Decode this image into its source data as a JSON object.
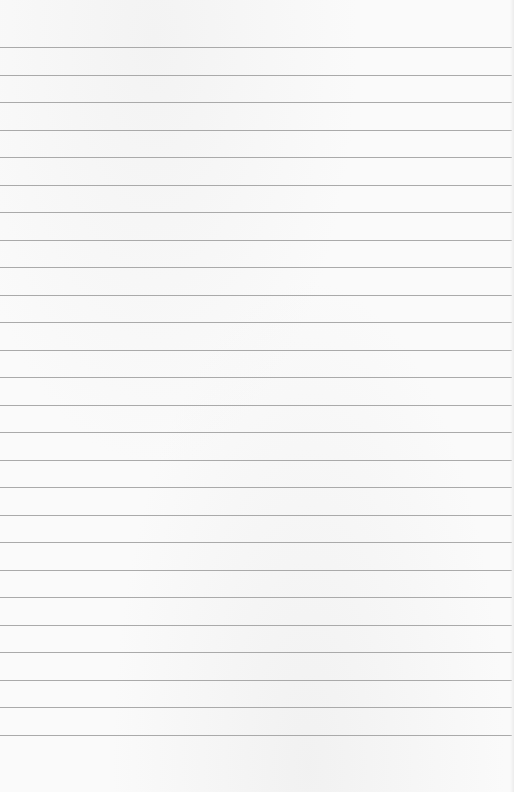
{
  "page": {
    "type": "lined-paper",
    "background_color": "#fafafa",
    "line_color": "#aaaaaa",
    "line_count": 26,
    "first_line_y": 47,
    "line_spacing": 27.5,
    "text": ""
  }
}
